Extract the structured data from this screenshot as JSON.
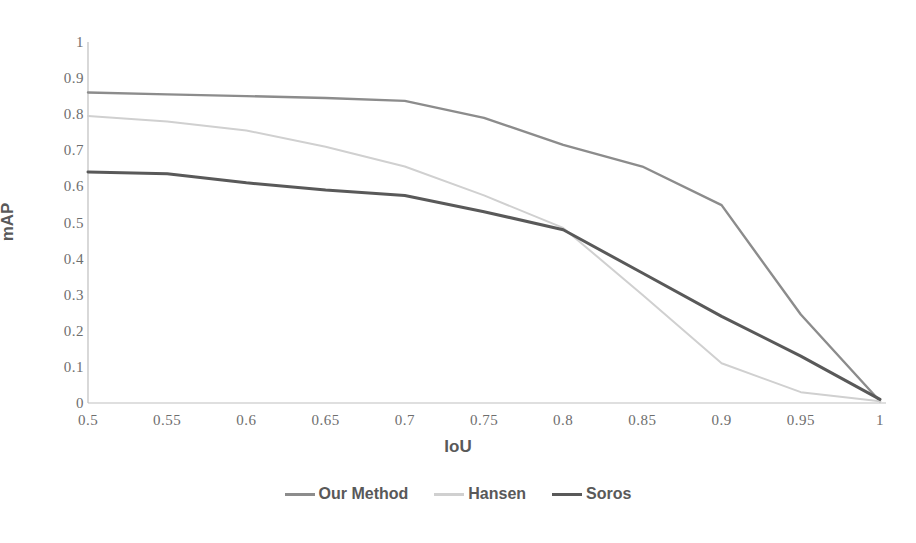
{
  "chart_data": {
    "type": "line",
    "title": "",
    "xlabel": "IoU",
    "ylabel": "mAP",
    "x": [
      0.5,
      0.55,
      0.6,
      0.65,
      0.7,
      0.75,
      0.8,
      0.85,
      0.9,
      0.95,
      1
    ],
    "xticklabels": [
      "0.5",
      "0.55",
      "0.6",
      "0.65",
      "0.7",
      "0.75",
      "0.8",
      "0.85",
      "0.9",
      "0.95",
      "1"
    ],
    "yticklabels": [
      "1",
      "0.9",
      "0.8",
      "0.7",
      "0.6",
      "0.5",
      "0.4",
      "0.3",
      "0.2",
      "0.1",
      "0"
    ],
    "ylim": [
      0,
      1
    ],
    "xlim": [
      0.5,
      1
    ],
    "grid": false,
    "legend_position": "bottom",
    "series": [
      {
        "name": "Our Method",
        "color": "#8c8c8c",
        "width": 2.4,
        "values": [
          0.86,
          0.855,
          0.85,
          0.845,
          0.837,
          0.79,
          0.715,
          0.655,
          0.548,
          0.245,
          0.005
        ]
      },
      {
        "name": "Hansen",
        "color": "#d0d0d0",
        "width": 2.0,
        "values": [
          0.795,
          0.78,
          0.755,
          0.71,
          0.655,
          0.575,
          0.485,
          0.3,
          0.11,
          0.03,
          0.005
        ]
      },
      {
        "name": "Soros",
        "color": "#595959",
        "width": 3.0,
        "values": [
          0.64,
          0.635,
          0.61,
          0.59,
          0.575,
          0.53,
          0.48,
          0.36,
          0.24,
          0.13,
          0.01
        ]
      }
    ]
  },
  "axis": {
    "axis_line_color": "#bfbfbf"
  }
}
